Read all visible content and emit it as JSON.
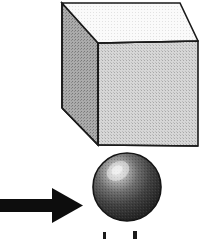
{
  "figure": {
    "name": "cube-and-sphere-figure",
    "width": 199,
    "height": 239,
    "background_color": "#ffffff"
  },
  "shapes": {
    "cube": {
      "label": "cube",
      "outline_color": "#1a1a1a",
      "outline_width": 1.6,
      "faces": {
        "top": {
          "label": "cube-top-face",
          "fill": "#f5f5f5",
          "points": "62,3 180,3 198,41 98,43"
        },
        "left": {
          "label": "cube-left-face",
          "fill": "#9a9a9a",
          "points": "62,3 98,43 98,145 62,108"
        },
        "front": {
          "label": "cube-front-face",
          "fill": "#c8c8c8",
          "points": "98,43 198,41 198,146 98,145"
        }
      }
    },
    "sphere": {
      "label": "sphere",
      "center_x": 127,
      "center_y": 187,
      "radius": 34,
      "outline_color": "#151515",
      "highlight_color": "#d8d8d8",
      "midtone_color": "#5a5a5a",
      "shadow_color": "#252525",
      "highlight_x": 118,
      "highlight_y": 171
    },
    "arrow": {
      "label": "arrow-right",
      "color": "#0d0d0d",
      "shaft": {
        "x": 0,
        "y": 199,
        "width": 55,
        "height": 13
      },
      "head": {
        "points": "52,188 83,205.5 52,223"
      },
      "direction": "right",
      "points_to": "sphere"
    }
  },
  "caption": {
    "label": "caption-clipped",
    "note": "Caption text is cut off at the bottom edge; only the tops of two glyphs are visible.",
    "fragments": [
      {
        "x": 103,
        "y": 232,
        "width": 3,
        "height": 7
      },
      {
        "x": 133,
        "y": 231,
        "width": 4,
        "height": 8
      }
    ]
  },
  "colors": {
    "ink": "#1a1a1a",
    "paper": "#ffffff",
    "light_gray": "#f5f5f5",
    "mid_gray": "#c8c8c8",
    "dark_gray": "#9a9a9a",
    "sphere_dark": "#252525"
  }
}
